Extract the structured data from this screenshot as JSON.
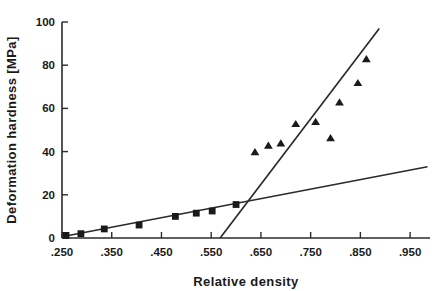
{
  "chart_data": {
    "type": "scatter",
    "title": "",
    "xlabel": "Relative density",
    "ylabel": "Deformation hardness [MPa]",
    "xlim": [
      0.25,
      0.99
    ],
    "ylim": [
      0,
      100
    ],
    "grid": false,
    "legend": "none",
    "x_ticks": [
      0.25,
      0.35,
      0.45,
      0.55,
      0.65,
      0.75,
      0.85,
      0.95
    ],
    "x_tick_labels": [
      ".250",
      ".350",
      ".450",
      ".550",
      ".650",
      ".750",
      ".850",
      ".950"
    ],
    "y_ticks": [
      0,
      20,
      40,
      60,
      80,
      100
    ],
    "y_tick_labels": [
      "0",
      "20",
      "40",
      "60",
      "80",
      "100"
    ],
    "series": [
      {
        "name": "low-density-branch",
        "marker": "square",
        "points": [
          {
            "x": 0.258,
            "y": 1.2
          },
          {
            "x": 0.288,
            "y": 2.0
          },
          {
            "x": 0.335,
            "y": 4.2
          },
          {
            "x": 0.405,
            "y": 6.0
          },
          {
            "x": 0.478,
            "y": 10.0
          },
          {
            "x": 0.52,
            "y": 11.5
          },
          {
            "x": 0.552,
            "y": 12.5
          },
          {
            "x": 0.6,
            "y": 15.5
          }
        ]
      },
      {
        "name": "high-density-branch",
        "marker": "triangle",
        "points": [
          {
            "x": 0.638,
            "y": 40.0
          },
          {
            "x": 0.665,
            "y": 43.0
          },
          {
            "x": 0.69,
            "y": 44.0
          },
          {
            "x": 0.72,
            "y": 53.0
          },
          {
            "x": 0.76,
            "y": 54.0
          },
          {
            "x": 0.79,
            "y": 46.5
          },
          {
            "x": 0.808,
            "y": 63.0
          },
          {
            "x": 0.845,
            "y": 72.0
          },
          {
            "x": 0.862,
            "y": 83.0
          }
        ]
      }
    ],
    "fit_lines": [
      {
        "name": "shallow-fit-line",
        "x_start": 0.255,
        "y_start": 0.8,
        "x_end": 0.985,
        "y_end": 33.0
      },
      {
        "name": "steep-fit-line",
        "x_start": 0.568,
        "y_start": 0.0,
        "x_end": 0.888,
        "y_end": 97.0
      }
    ]
  }
}
